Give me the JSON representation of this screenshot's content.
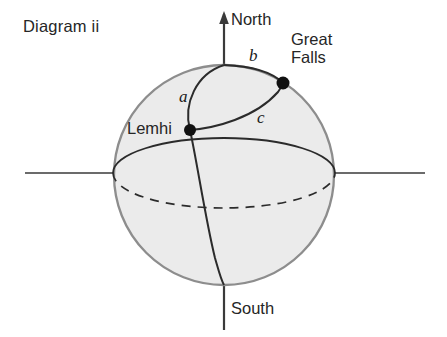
{
  "figure": {
    "title": "Diagram ii",
    "type": "sphere-great-circle-diagram",
    "background_color": "#ffffff",
    "sphere": {
      "fill_color": "#ebebeb",
      "outline_color": "#8a8a8a",
      "center_x": 224,
      "center_y": 175,
      "radius": 110
    },
    "line_color": "#2b2b2b",
    "axes": {
      "vertical_label_top": "North",
      "vertical_label_bottom": "South",
      "vertical_x": 224,
      "vertical_top_y": 14,
      "vertical_bottom_y": 330,
      "horizontal_y": 173,
      "horizontal_left_x": 25,
      "horizontal_right_x": 425,
      "arrow_at": "north"
    },
    "points": [
      {
        "name": "Lemhi",
        "label": "Lemhi",
        "x": 190,
        "y": 130,
        "label_x": 127,
        "label_y": 119,
        "dot_radius": 6
      },
      {
        "name": "Great Falls",
        "label": "Great Falls",
        "label_line_1": "Great",
        "label_line_2": "Falls",
        "x": 283,
        "y": 83,
        "label_x": 291,
        "label_y": 30,
        "dot_radius": 6.5
      }
    ],
    "arcs": [
      {
        "id": "a",
        "label": "a",
        "description": "meridian arc from north pole through Lemhi continuing to south pole",
        "label_x": 179,
        "label_y": 87
      },
      {
        "id": "b",
        "label": "b",
        "description": "great circle arc from north pole to Great Falls along upper sphere edge",
        "label_x": 249,
        "label_y": 46
      },
      {
        "id": "c",
        "label": "c",
        "description": "great circle arc from Lemhi to Great Falls",
        "label_x": 257,
        "label_y": 108
      }
    ],
    "equator": {
      "back_half_style": "dashed",
      "front_half_style": "solid",
      "rx": 111,
      "ry": 35
    }
  }
}
